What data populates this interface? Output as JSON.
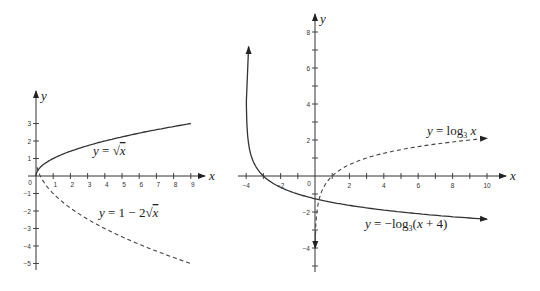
{
  "chart_data": [
    {
      "type": "line",
      "title": "",
      "xlabel": "x",
      "ylabel": "y",
      "x_ticks": [
        "0",
        "1",
        "2",
        "3",
        "4",
        "5",
        "6",
        "7",
        "8",
        "9"
      ],
      "y_ticks": [
        "3",
        "2",
        "1",
        "-1",
        "-2",
        "-3",
        "-4",
        "-5"
      ],
      "xlim": [
        0,
        9
      ],
      "ylim": [
        -5,
        3
      ],
      "grid": false,
      "series": [
        {
          "name": "y = √x",
          "style": "solid",
          "x": [
            0,
            0.25,
            1,
            2,
            3,
            4,
            5,
            6,
            7,
            8,
            9
          ],
          "values": [
            0,
            0.5,
            1,
            1.41,
            1.73,
            2,
            2.24,
            2.45,
            2.65,
            2.83,
            3
          ]
        },
        {
          "name": "y = 1 − 2√x",
          "style": "dashed",
          "x": [
            0,
            0.25,
            1,
            2,
            3,
            4,
            5,
            6,
            7,
            8,
            9
          ],
          "values": [
            1,
            0,
            -1,
            -1.83,
            -2.46,
            -3,
            -3.47,
            -3.9,
            -4.29,
            -4.66,
            -5
          ]
        }
      ]
    },
    {
      "type": "line",
      "title": "",
      "xlabel": "x",
      "ylabel": "y",
      "x_ticks": [
        "-4",
        "-2",
        "0",
        "2",
        "4",
        "6",
        "8",
        "10"
      ],
      "y_ticks": [
        "8",
        "6",
        "4",
        "2",
        "-2",
        "-4"
      ],
      "xlim": [
        -4,
        10
      ],
      "ylim": [
        -5,
        8
      ],
      "grid": false,
      "series": [
        {
          "name": "y = −log₃(x + 4)",
          "style": "solid",
          "x": [
            -3.99,
            -3.9,
            -3.5,
            -3,
            -2,
            -1,
            0,
            2,
            4,
            6,
            8,
            10
          ],
          "values": [
            4.19,
            2.1,
            0.63,
            0,
            -0.63,
            -1,
            -1.26,
            -1.63,
            -1.89,
            -2.1,
            -2.26,
            -2.4
          ]
        },
        {
          "name": "y = log₃ x",
          "style": "dashed",
          "x": [
            0.012,
            0.05,
            0.1,
            0.5,
            1,
            2,
            3,
            4,
            6,
            8,
            10
          ],
          "values": [
            -4,
            -2.73,
            -2.1,
            -0.63,
            0,
            0.63,
            1,
            1.26,
            1.63,
            1.89,
            2.1
          ]
        }
      ]
    }
  ],
  "left_chart": {
    "x_axis_label": "x",
    "y_axis_label": "y",
    "origin_label": "0",
    "x_tick_labels": [
      "1",
      "2",
      "3",
      "4",
      "5",
      "6",
      "7",
      "8",
      "9"
    ],
    "y_tick_labels": [
      "3",
      "2",
      "1",
      "−1",
      "−2",
      "−3",
      "−4",
      "−5"
    ],
    "eq1": {
      "prefix": "y",
      "eq": " = ",
      "body": "x"
    },
    "eq2": {
      "prefix": "y",
      "eq": " = 1 − 2",
      "body": "x"
    }
  },
  "right_chart": {
    "x_axis_label": "x",
    "y_axis_label": "y",
    "origin_label": "0",
    "x_tick_labels": [
      "−4",
      "−2",
      "2",
      "4",
      "6",
      "8",
      "10"
    ],
    "y_tick_labels": [
      "8",
      "6",
      "4",
      "2",
      "−2",
      "−4"
    ],
    "eq1": {
      "prefix": "y",
      "eq": " = log",
      "sub": "3",
      "var": " x"
    },
    "eq2": {
      "prefix": "y",
      "eq": " = −log",
      "sub": "3",
      "open": "(",
      "var": "x",
      "rest": " + 4)"
    }
  }
}
